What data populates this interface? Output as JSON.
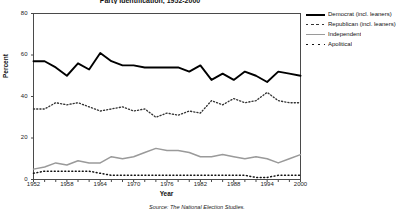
{
  "chart_data": {
    "type": "line",
    "title": "Party Identification, 1952-2000",
    "xlabel": "Year",
    "ylabel": "Percent",
    "xlim": [
      1952,
      2000
    ],
    "ylim": [
      0,
      80
    ],
    "grid": false,
    "legend_position": "right-outside",
    "source": "Source: The National Election Studies.",
    "x": [
      1952,
      1954,
      1956,
      1958,
      1960,
      1962,
      1964,
      1966,
      1968,
      1970,
      1972,
      1974,
      1976,
      1978,
      1980,
      1982,
      1984,
      1986,
      1988,
      1990,
      1992,
      1994,
      1996,
      1998,
      2000
    ],
    "xticks": [
      1952,
      1954,
      1956,
      1958,
      1960,
      1962,
      1964,
      1966,
      1968,
      1970,
      1972,
      1974,
      1976,
      1978,
      1980,
      1982,
      1984,
      1986,
      1988,
      1990,
      1992,
      1994,
      1996,
      1998,
      2000
    ],
    "xtick_labels": [
      "1952",
      "1958",
      "1964",
      "1970",
      "1976",
      "1982",
      "1988",
      "1994",
      "2000"
    ],
    "xtick_label_values": [
      1952,
      1958,
      1964,
      1970,
      1976,
      1982,
      1988,
      1994,
      2000
    ],
    "yticks": [
      0,
      20,
      40,
      60,
      80
    ],
    "ytick_labels": [
      "0",
      "20",
      "40",
      "60",
      "80"
    ],
    "series": [
      {
        "name": "Democrat (incl. leaners)",
        "style": "solid-thick",
        "color": "#000000",
        "values": [
          57,
          57,
          54,
          50,
          56,
          53,
          61,
          57,
          55,
          55,
          54,
          54,
          54,
          54,
          52,
          55,
          48,
          51,
          48,
          52,
          50,
          47,
          52,
          51,
          50
        ]
      },
      {
        "name": "Republican (incl. leaners)",
        "style": "dotted",
        "color": "#333333",
        "values": [
          34,
          34,
          37,
          36,
          37,
          35,
          33,
          34,
          35,
          33,
          34,
          30,
          32,
          31,
          33,
          32,
          38,
          36,
          39,
          37,
          38,
          42,
          38,
          37,
          37
        ]
      },
      {
        "name": "Independent",
        "style": "solid-gray",
        "color": "#9a9a9a",
        "values": [
          5,
          6,
          8,
          7,
          9,
          8,
          8,
          11,
          10,
          11,
          13,
          15,
          14,
          14,
          13,
          11,
          11,
          12,
          11,
          10,
          11,
          10,
          8,
          10,
          12
        ]
      },
      {
        "name": "Apolitical",
        "style": "dotted-small",
        "color": "#111111",
        "values": [
          3,
          4,
          4,
          4,
          4,
          4,
          3,
          2,
          2,
          2,
          2,
          2,
          2,
          2,
          2,
          2,
          2,
          2,
          2,
          2,
          1,
          1,
          2,
          2,
          2
        ]
      }
    ]
  }
}
